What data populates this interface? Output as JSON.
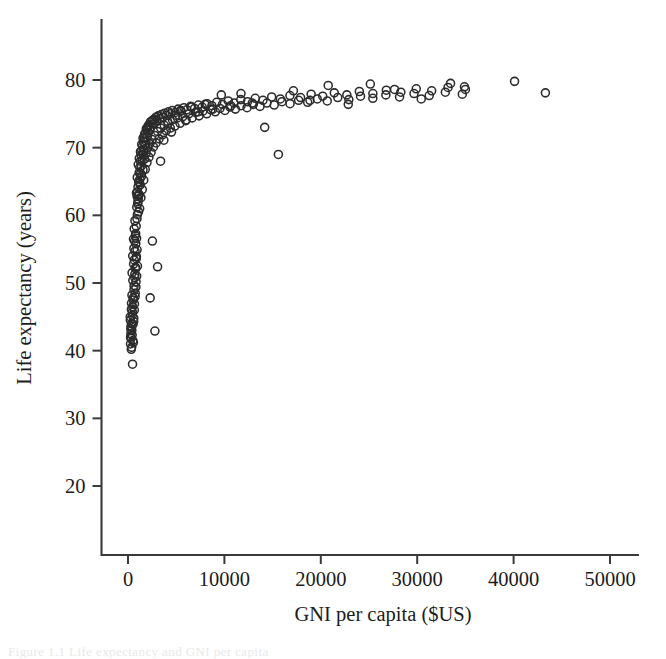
{
  "figure": {
    "background_color": "#ffffff",
    "ink_color": "#2b2b2b",
    "caption_fragment": "Figure 1.1  Life expectancy and GNI per capita"
  },
  "chart_data": {
    "type": "scatter",
    "title": "",
    "subtitle": "",
    "xlabel": "GNI per capita ($US)",
    "ylabel": "Life expectancy (years)",
    "xlim": [
      -2800,
      53000
    ],
    "ylim": [
      16.5,
      86.5
    ],
    "xticks": [
      0,
      10000,
      20000,
      30000,
      40000,
      50000
    ],
    "xticklabels": [
      "0",
      "10000",
      "20000",
      "30000",
      "40000",
      "50000"
    ],
    "yticks": [
      20,
      30,
      40,
      50,
      60,
      70,
      80
    ],
    "yticklabels": [
      "20",
      "30",
      "40",
      "50",
      "60",
      "70",
      "80"
    ],
    "grid": false,
    "legend": null,
    "marker": {
      "shape": "circle-open",
      "radius_px": 4.0,
      "edge_color": "#2b2b2b",
      "fill": "none",
      "line_width": 1.55
    },
    "series": [
      {
        "name": "Countries",
        "x": [
          240,
          290,
          320,
          350,
          380,
          410,
          430,
          460,
          470,
          500,
          520,
          540,
          560,
          580,
          600,
          610,
          630,
          650,
          670,
          690,
          710,
          730,
          750,
          770,
          790,
          810,
          830,
          850,
          870,
          890,
          910,
          930,
          950,
          970,
          990,
          1010,
          1040,
          1070,
          1100,
          1130,
          1160,
          1190,
          1220,
          1250,
          1280,
          1310,
          1350,
          1390,
          1430,
          1470,
          1510,
          1560,
          1600,
          1650,
          1700,
          1750,
          1800,
          1860,
          1920,
          1980,
          2040,
          2100,
          2180,
          2250,
          2330,
          2400,
          2500,
          2600,
          2700,
          2800,
          2900,
          3000,
          3150,
          3300,
          3450,
          3600,
          3800,
          4000,
          4200,
          4400,
          4600,
          4900,
          5200,
          5500,
          5800,
          6100,
          6500,
          6900,
          7300,
          7700,
          8200,
          8700,
          9200,
          9800,
          10400,
          11000,
          11700,
          12400,
          13200,
          14000,
          14900,
          15800,
          16800,
          17900,
          19000,
          20200,
          21400,
          22700,
          24000,
          25400,
          26800,
          28300,
          29900,
          31500,
          33200,
          35000,
          40100,
          43300,
          260,
          300,
          340,
          370,
          400,
          440,
          480,
          510,
          550,
          590,
          620,
          660,
          700,
          740,
          780,
          820,
          860,
          900,
          940,
          980,
          1030,
          1090,
          1150,
          1210,
          1270,
          1340,
          1410,
          1480,
          1550,
          1630,
          1710,
          1790,
          1880,
          1970,
          2070,
          2170,
          2280,
          2390,
          2510,
          2640,
          2770,
          2910,
          3060,
          3220,
          3390,
          3570,
          3760,
          3960,
          4170,
          4390,
          4620,
          4870,
          5130,
          5400,
          5690,
          5990,
          6310,
          6650,
          7000,
          7370,
          7760,
          8170,
          8600,
          9060,
          9540,
          10050,
          10580,
          11140,
          11730,
          12350,
          13000,
          13690,
          14410,
          15170,
          15970,
          16810,
          17700,
          18640,
          19630,
          20670,
          21760,
          22910,
          24120,
          25400,
          26750,
          28170,
          29670,
          31250,
          32920,
          34680,
          230,
          270,
          310,
          360,
          420,
          490,
          570,
          640,
          720,
          800,
          880,
          960,
          1060,
          1170,
          1290,
          1420,
          1560,
          1720,
          1900,
          2090,
          2300,
          2530,
          2790,
          3070,
          3380,
          3720,
          4100,
          4510,
          4960,
          5460,
          6010,
          6610,
          7270,
          8000,
          8800,
          9680,
          10650,
          11720,
          12890,
          14180,
          15600,
          17160,
          18880,
          20770,
          22850,
          25140,
          27650,
          30420,
          33460,
          34900
        ],
        "y": [
          44.5,
          43.2,
          41.8,
          46.1,
          40.5,
          48.2,
          42.3,
          45.7,
          38.0,
          50.4,
          43.9,
          47.5,
          41.2,
          52.8,
          44.8,
          55.1,
          49.6,
          53.4,
          46.9,
          56.2,
          51.3,
          54.7,
          48.5,
          57.0,
          52.1,
          55.8,
          50.2,
          58.4,
          53.9,
          56.6,
          61.2,
          59.5,
          62.8,
          60.1,
          63.5,
          61.7,
          64.2,
          62.4,
          65.0,
          63.1,
          66.3,
          64.8,
          67.1,
          65.4,
          68.0,
          66.2,
          68.9,
          67.3,
          69.6,
          68.1,
          70.2,
          69.0,
          70.9,
          69.7,
          71.5,
          70.4,
          72.1,
          71.0,
          72.6,
          71.6,
          73.0,
          72.2,
          73.4,
          72.7,
          73.8,
          73.1,
          74.0,
          73.5,
          74.2,
          73.7,
          74.5,
          74.0,
          74.7,
          74.3,
          74.9,
          74.5,
          75.1,
          74.8,
          75.3,
          75.0,
          75.5,
          75.2,
          75.7,
          75.4,
          75.9,
          75.6,
          76.1,
          75.8,
          76.3,
          76.0,
          76.5,
          76.2,
          76.7,
          76.4,
          76.9,
          76.6,
          77.1,
          76.8,
          77.3,
          77.0,
          77.5,
          77.2,
          77.7,
          77.4,
          77.9,
          77.6,
          78.1,
          77.8,
          78.3,
          78.0,
          78.5,
          78.2,
          78.7,
          78.4,
          78.9,
          78.6,
          79.8,
          78.1,
          41.0,
          42.5,
          40.2,
          44.0,
          43.0,
          45.2,
          46.5,
          41.5,
          47.8,
          44.3,
          49.0,
          46.0,
          50.8,
          48.0,
          52.3,
          49.4,
          53.6,
          51.0,
          54.9,
          52.5,
          62.0,
          60.5,
          63.0,
          61.0,
          64.5,
          62.6,
          65.8,
          63.8,
          66.7,
          65.2,
          68.3,
          66.8,
          69.2,
          67.8,
          70.0,
          68.6,
          70.6,
          69.3,
          71.2,
          70.1,
          71.8,
          70.7,
          72.4,
          71.3,
          72.9,
          71.9,
          73.3,
          72.5,
          73.6,
          72.9,
          74.1,
          73.2,
          74.4,
          73.6,
          74.6,
          74.0,
          75.0,
          74.4,
          75.2,
          74.7,
          75.4,
          75.0,
          75.6,
          75.3,
          75.8,
          75.5,
          76.0,
          75.7,
          76.2,
          75.9,
          76.4,
          76.1,
          76.6,
          76.3,
          76.8,
          76.5,
          77.0,
          76.7,
          77.2,
          76.9,
          77.4,
          77.1,
          77.6,
          77.3,
          77.8,
          77.5,
          78.0,
          77.7,
          78.2,
          77.9,
          45.0,
          42.0,
          43.6,
          47.0,
          51.5,
          54.0,
          56.5,
          58.0,
          59.2,
          57.3,
          63.3,
          65.6,
          67.5,
          68.4,
          69.4,
          70.5,
          71.4,
          72.0,
          72.8,
          73.2,
          47.8,
          56.2,
          42.9,
          52.4,
          68.0,
          71.1,
          73.9,
          72.3,
          74.8,
          75.5,
          74.1,
          76.0,
          75.3,
          76.4,
          75.7,
          77.8,
          76.2,
          78.0,
          76.6,
          73.0,
          69.0,
          78.4,
          77.0,
          79.2,
          76.4,
          79.4,
          78.6,
          77.2,
          79.5,
          79.0
        ]
      }
    ]
  }
}
